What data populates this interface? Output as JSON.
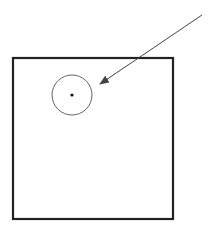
{
  "canvas": {
    "width": 209,
    "height": 230,
    "background": "#ffffff"
  },
  "colors": {
    "frame_stroke": "#222222",
    "circle_stroke": "#555555",
    "dot_fill": "#111111",
    "arrow_stroke": "#444444"
  },
  "frame": {
    "x": 13,
    "y": 58,
    "width": 160,
    "height": 161,
    "stroke_width": 2.2
  },
  "circle": {
    "cx": 72,
    "cy": 95,
    "r": 20,
    "stroke_width": 0.9
  },
  "center_dot": {
    "cx": 72,
    "cy": 95,
    "r": 1.6
  },
  "arrow": {
    "x1": 202,
    "y1": 15,
    "x2": 100,
    "y2": 84,
    "stroke_width": 1
  }
}
